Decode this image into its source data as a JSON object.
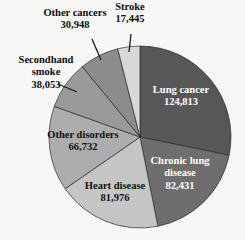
{
  "chart_data": {
    "type": "pie",
    "title": "",
    "subtitle": "",
    "xlabel": "",
    "ylabel": "",
    "legend_position": "none",
    "grid": false,
    "total": 442398,
    "units": "deaths per year",
    "categories": [
      "Lung cancer",
      "Chronic lung disease",
      "Heart disease",
      "Other disorders",
      "Secondhand smoke",
      "Other cancers",
      "Stroke"
    ],
    "values": [
      124813,
      82431,
      81976,
      66732,
      38053,
      30948,
      17445
    ],
    "value_labels": [
      "124,813",
      "82,431",
      "81,976",
      "66,732",
      "38,053",
      "30,948",
      "17,445"
    ],
    "slices": [
      {
        "name": "Lung cancer",
        "value": 124813,
        "value_label": "124,813",
        "color": "#575757",
        "label_placement": "inside",
        "label_color": "inside-light",
        "line1": "Lung cancer",
        "line2": "124,813",
        "label_x": 181,
        "label_y": 97
      },
      {
        "name": "Chronic lung disease",
        "value": 82431,
        "value_label": "82,431",
        "color": "#6e6e6e",
        "label_placement": "inside",
        "label_color": "inside-light",
        "line1": "Chronic lung",
        "line2": "disease",
        "line3": "82,431",
        "label_x": 180,
        "label_y": 174
      },
      {
        "name": "Heart disease",
        "value": 81976,
        "value_label": "81,976",
        "color": "#c5c5c5",
        "label_placement": "inside",
        "label_color": "inside-dark",
        "line1": "Heart disease",
        "line2": "81,976",
        "label_x": 115,
        "label_y": 193
      },
      {
        "name": "Other disorders",
        "value": 66732,
        "value_label": "66,732",
        "color": "#adadad",
        "label_placement": "inside",
        "label_color": "inside-dark",
        "line1": "Other disorders",
        "line2": "66,732",
        "label_x": 83,
        "label_y": 142
      },
      {
        "name": "Secondhand smoke",
        "value": 38053,
        "value_label": "38,053",
        "color": "#9a9a9a",
        "label_placement": "callout",
        "line1": "Secondhand",
        "line2": "smoke",
        "line3": "38,053",
        "label_x": 46,
        "label_y": 73,
        "leader": {
          "x1": 58,
          "y1": 84,
          "x2": 77,
          "y2": 92
        }
      },
      {
        "name": "Other cancers",
        "value": 30948,
        "value_label": "30,948",
        "color": "#8c8c8c",
        "label_placement": "callout",
        "line1": "Other cancers",
        "line2": "30,948",
        "label_x": 75,
        "label_y": 20,
        "leader": {
          "x1": 92,
          "y1": 39,
          "x2": 101,
          "y2": 60
        }
      },
      {
        "name": "Stroke",
        "value": 17445,
        "value_label": "17,445",
        "color": "#d8d8d8",
        "label_placement": "callout",
        "line1": "Stroke",
        "line2": "17,445",
        "label_x": 130,
        "label_y": 14,
        "leader": {
          "x1": 131,
          "y1": 34,
          "x2": 129,
          "y2": 52
        }
      }
    ],
    "geometry": {
      "center_x": 140,
      "center_y": 137,
      "radius": 91,
      "start_angle_deg": -90,
      "direction": "clockwise"
    },
    "colors": {
      "background": "#f7f7f5",
      "slice_outline": "#2a2a2a",
      "text_dark": "#0d0d0d",
      "text_light": "#ffffff"
    }
  }
}
